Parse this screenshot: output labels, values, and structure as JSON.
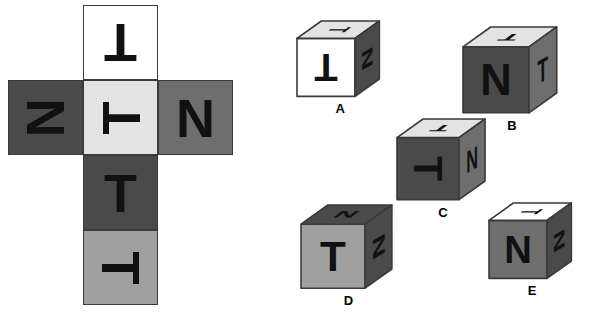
{
  "puzzle": {
    "type": "cube-folding-spatial-reasoning",
    "colors": {
      "white": "#ffffff",
      "light_gray": "#e3e3e3",
      "medium_light_gray": "#a0a0a0",
      "medium_gray": "#6e6e6e",
      "dark_gray": "#4a4a4a",
      "outline": "#3a3a3a",
      "letter": "#111111",
      "background": "#ffffff"
    }
  },
  "net": {
    "name": "cube-net",
    "cells": [
      {
        "id": "net-cell-top",
        "letter": "T",
        "rotation": 180,
        "fill": "#ffffff",
        "col": 1,
        "row": 0
      },
      {
        "id": "net-cell-left",
        "letter": "N",
        "rotation": 90,
        "fill": "#4a4a4a",
        "col": 0,
        "row": 1
      },
      {
        "id": "net-cell-center",
        "letter": "T",
        "rotation": 270,
        "fill": "#e3e3e3",
        "col": 1,
        "row": 1
      },
      {
        "id": "net-cell-right",
        "letter": "N",
        "rotation": 0,
        "fill": "#6e6e6e",
        "col": 2,
        "row": 1
      },
      {
        "id": "net-cell-lower",
        "letter": "T",
        "rotation": 0,
        "fill": "#4a4a4a",
        "col": 1,
        "row": 2
      },
      {
        "id": "net-cell-bottom",
        "letter": "T",
        "rotation": 90,
        "fill": "#a0a0a0",
        "col": 1,
        "row": 3
      }
    ]
  },
  "options": [
    {
      "label": "A",
      "front": {
        "letter": "T",
        "rotation": 180,
        "fill": "#ffffff"
      },
      "top": {
        "letter": "T",
        "rotation": 90,
        "fill": "#e3e3e3"
      },
      "right": {
        "letter": "N",
        "rotation": 90,
        "fill": "#4a4a4a"
      }
    },
    {
      "label": "B",
      "front": {
        "letter": "N",
        "rotation": 0,
        "fill": "#4a4a4a"
      },
      "top": {
        "letter": "T",
        "rotation": 180,
        "fill": "#e3e3e3"
      },
      "right": {
        "letter": "T",
        "rotation": 0,
        "fill": "#6e6e6e"
      }
    },
    {
      "label": "C",
      "front": {
        "letter": "T",
        "rotation": 90,
        "fill": "#4a4a4a"
      },
      "top": {
        "letter": "T",
        "rotation": 180,
        "fill": "#e3e3e3"
      },
      "right": {
        "letter": "N",
        "rotation": 0,
        "fill": "#6e6e6e"
      }
    },
    {
      "label": "D",
      "front": {
        "letter": "T",
        "rotation": 0,
        "fill": "#a0a0a0"
      },
      "top": {
        "letter": "N",
        "rotation": 180,
        "fill": "#4a4a4a"
      },
      "right": {
        "letter": "N",
        "rotation": 90,
        "fill": "#4a4a4a"
      }
    },
    {
      "label": "E",
      "front": {
        "letter": "N",
        "rotation": 0,
        "fill": "#6e6e6e"
      },
      "top": {
        "letter": "T",
        "rotation": 90,
        "fill": "#ffffff"
      },
      "right": {
        "letter": "N",
        "rotation": 90,
        "fill": "#4a4a4a"
      }
    }
  ],
  "layout": {
    "net_origin": {
      "x": 8,
      "y": 5
    },
    "net_cell_size": 75,
    "cube_positions": [
      {
        "label": "A",
        "x": 296,
        "y": 20,
        "size": 58
      },
      {
        "label": "B",
        "x": 462,
        "y": 26,
        "size": 66
      },
      {
        "label": "C",
        "x": 396,
        "y": 118,
        "size": 62
      },
      {
        "label": "D",
        "x": 300,
        "y": 204,
        "size": 64
      },
      {
        "label": "E",
        "x": 488,
        "y": 202,
        "size": 58
      }
    ]
  }
}
